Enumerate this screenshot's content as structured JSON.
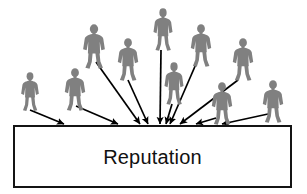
{
  "diagram": {
    "type": "concept-diagram",
    "title_text": "Reputation",
    "canvas": {
      "width": 307,
      "height": 194,
      "background": "#ffffff"
    },
    "colors": {
      "person_fill": "#808080",
      "arrow_stroke": "#000000",
      "box_border": "#141414",
      "box_fill": "#ffffff",
      "label_color": "#111111"
    },
    "box": {
      "label": "Reputation",
      "x": 13,
      "y": 125,
      "width": 279,
      "height": 63,
      "border_width": 2,
      "font_size": 20
    },
    "people": [
      {
        "id": "person-1",
        "name": "person-far-left",
        "x": 17,
        "y": 72,
        "w": 26,
        "h": 40
      },
      {
        "id": "person-2",
        "name": "person-left-lower",
        "x": 60,
        "y": 68,
        "w": 30,
        "h": 44
      },
      {
        "id": "person-3",
        "name": "person-left-upper",
        "x": 78,
        "y": 24,
        "w": 32,
        "h": 46
      },
      {
        "id": "person-4",
        "name": "person-left-mid",
        "x": 113,
        "y": 38,
        "w": 30,
        "h": 44
      },
      {
        "id": "person-5",
        "name": "person-top-center",
        "x": 149,
        "y": 8,
        "w": 28,
        "h": 44
      },
      {
        "id": "person-6",
        "name": "person-center-lower",
        "x": 160,
        "y": 62,
        "w": 28,
        "h": 44
      },
      {
        "id": "person-7",
        "name": "person-right-upper",
        "x": 186,
        "y": 24,
        "w": 30,
        "h": 44
      },
      {
        "id": "person-8",
        "name": "person-right-mid",
        "x": 228,
        "y": 38,
        "w": 30,
        "h": 44
      },
      {
        "id": "person-9",
        "name": "person-right-lower",
        "x": 207,
        "y": 82,
        "w": 30,
        "h": 44
      },
      {
        "id": "person-10",
        "name": "person-far-right",
        "x": 258,
        "y": 80,
        "w": 30,
        "h": 44
      }
    ],
    "arrows": [
      {
        "id": "arrow-1",
        "name": "arrow-from-far-left",
        "x1": 30,
        "y1": 110,
        "x2": 64,
        "y2": 124
      },
      {
        "id": "arrow-2",
        "name": "arrow-from-left-lower",
        "x1": 76,
        "y1": 106,
        "x2": 118,
        "y2": 124
      },
      {
        "id": "arrow-3",
        "name": "arrow-from-left-upper",
        "x1": 96,
        "y1": 62,
        "x2": 140,
        "y2": 124
      },
      {
        "id": "arrow-4",
        "name": "arrow-from-left-mid",
        "x1": 128,
        "y1": 80,
        "x2": 148,
        "y2": 124
      },
      {
        "id": "arrow-5",
        "name": "arrow-from-top-center",
        "x1": 161,
        "y1": 50,
        "x2": 160,
        "y2": 124
      },
      {
        "id": "arrow-6",
        "name": "arrow-from-center-lower",
        "x1": 172,
        "y1": 104,
        "x2": 166,
        "y2": 124
      },
      {
        "id": "arrow-7",
        "name": "arrow-from-right-upper",
        "x1": 196,
        "y1": 64,
        "x2": 170,
        "y2": 124
      },
      {
        "id": "arrow-8",
        "name": "arrow-from-right-mid",
        "x1": 238,
        "y1": 80,
        "x2": 180,
        "y2": 124
      },
      {
        "id": "arrow-9",
        "name": "arrow-from-right-lower",
        "x1": 216,
        "y1": 118,
        "x2": 196,
        "y2": 124
      },
      {
        "id": "arrow-10",
        "name": "arrow-from-far-right",
        "x1": 268,
        "y1": 114,
        "x2": 222,
        "y2": 124
      }
    ]
  }
}
